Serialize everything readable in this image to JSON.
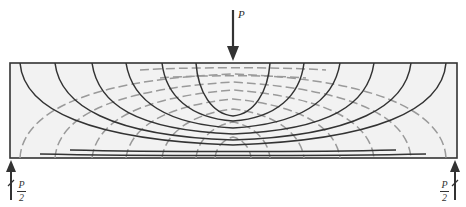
{
  "diagram": {
    "type": "stress-trajectories-simply-supported-beam",
    "beam": {
      "x": 10,
      "y": 63,
      "width": 447,
      "height": 95,
      "fill": "#f2f2f2",
      "stroke": "#333333"
    },
    "colors": {
      "compression": "#333333",
      "tension": "#9a9a9a",
      "arrow": "#333333"
    },
    "load": {
      "label": "P",
      "x": 233,
      "y_top": 10,
      "y_bottom": 60
    },
    "reactions": [
      {
        "side": "left",
        "label_num": "P",
        "label_den": "2",
        "x": 11
      },
      {
        "side": "right",
        "label_num": "P",
        "label_den": "2",
        "x": 455
      }
    ],
    "legend": {
      "solid": "compressive stress trajectories",
      "dashed": "tensile stress trajectories"
    }
  }
}
